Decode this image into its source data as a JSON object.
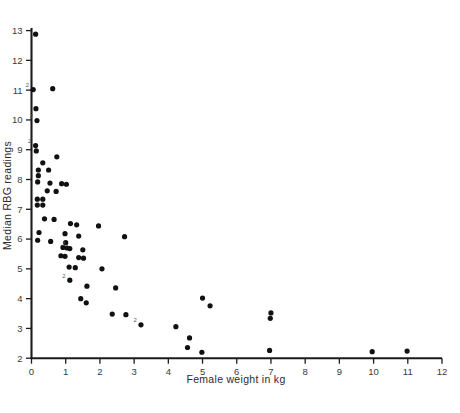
{
  "chart_data": {
    "type": "scatter",
    "title": "",
    "xlabel": "Female weight in kg",
    "ylabel": "Median RBG readings",
    "xlim": [
      0,
      12
    ],
    "ylim": [
      2,
      13
    ],
    "xticks": [
      0,
      1,
      2,
      3,
      4,
      5,
      6,
      7,
      8,
      9,
      10,
      11,
      12
    ],
    "yticks": [
      2,
      3,
      4,
      5,
      6,
      7,
      8,
      9,
      10,
      11,
      12,
      13
    ],
    "xtick_labels": [
      "0",
      "1",
      "2",
      "3",
      "4",
      "5",
      "6",
      "7",
      "8",
      "9",
      "10",
      "11",
      "12"
    ],
    "ytick_labels": [
      "2",
      "3",
      "4",
      "5",
      "6",
      "7",
      "8",
      "9",
      "10",
      "11",
      "12",
      "13"
    ],
    "grid": false,
    "legend": "none",
    "marker": "filled-circle",
    "marker_color": "#111111",
    "axis_color": "#1b1b1b",
    "overlap_annotation_note": "small '2' glyphs mark coincident duplicate observations",
    "points": [
      {
        "x": 0.12,
        "y": 12.88
      },
      {
        "x": 0.62,
        "y": 11.05
      },
      {
        "x": 0.05,
        "y": 11.02,
        "n": 2
      },
      {
        "x": 0.13,
        "y": 10.38
      },
      {
        "x": 0.16,
        "y": 9.98,
        "n": 2
      },
      {
        "x": 0.12,
        "y": 9.14,
        "n": 2
      },
      {
        "x": 0.14,
        "y": 8.96
      },
      {
        "x": 0.74,
        "y": 8.76
      },
      {
        "x": 0.33,
        "y": 8.56
      },
      {
        "x": 0.2,
        "y": 8.32
      },
      {
        "x": 0.5,
        "y": 8.32
      },
      {
        "x": 0.2,
        "y": 8.13
      },
      {
        "x": 0.18,
        "y": 7.92
      },
      {
        "x": 0.54,
        "y": 7.88
      },
      {
        "x": 0.88,
        "y": 7.86
      },
      {
        "x": 1.02,
        "y": 7.84
      },
      {
        "x": 0.46,
        "y": 7.62
      },
      {
        "x": 0.72,
        "y": 7.6
      },
      {
        "x": 0.17,
        "y": 7.34
      },
      {
        "x": 0.33,
        "y": 7.34
      },
      {
        "x": 0.17,
        "y": 7.14
      },
      {
        "x": 0.33,
        "y": 7.14
      },
      {
        "x": 0.38,
        "y": 6.68
      },
      {
        "x": 0.66,
        "y": 6.66
      },
      {
        "x": 1.14,
        "y": 6.52
      },
      {
        "x": 1.32,
        "y": 6.48
      },
      {
        "x": 1.96,
        "y": 6.44
      },
      {
        "x": 0.22,
        "y": 6.22
      },
      {
        "x": 0.98,
        "y": 6.18
      },
      {
        "x": 1.38,
        "y": 6.1
      },
      {
        "x": 2.72,
        "y": 6.08
      },
      {
        "x": 0.18,
        "y": 5.96
      },
      {
        "x": 0.56,
        "y": 5.92
      },
      {
        "x": 1.0,
        "y": 5.88
      },
      {
        "x": 0.92,
        "y": 5.72
      },
      {
        "x": 1.04,
        "y": 5.7
      },
      {
        "x": 1.12,
        "y": 5.68,
        "n": 2
      },
      {
        "x": 1.5,
        "y": 5.64
      },
      {
        "x": 0.86,
        "y": 5.44
      },
      {
        "x": 0.98,
        "y": 5.42
      },
      {
        "x": 1.38,
        "y": 5.38
      },
      {
        "x": 1.52,
        "y": 5.36
      },
      {
        "x": 1.1,
        "y": 5.06
      },
      {
        "x": 1.28,
        "y": 5.04
      },
      {
        "x": 2.06,
        "y": 5.0
      },
      {
        "x": 1.12,
        "y": 4.62,
        "n": 2
      },
      {
        "x": 1.62,
        "y": 4.42
      },
      {
        "x": 2.46,
        "y": 4.36
      },
      {
        "x": 1.44,
        "y": 4.0
      },
      {
        "x": 5.0,
        "y": 4.02
      },
      {
        "x": 1.6,
        "y": 3.86
      },
      {
        "x": 5.22,
        "y": 3.76
      },
      {
        "x": 2.36,
        "y": 3.48
      },
      {
        "x": 2.76,
        "y": 3.46
      },
      {
        "x": 7.0,
        "y": 3.52
      },
      {
        "x": 6.98,
        "y": 3.34
      },
      {
        "x": 3.2,
        "y": 3.12,
        "n": 2
      },
      {
        "x": 4.22,
        "y": 3.06
      },
      {
        "x": 4.62,
        "y": 2.68
      },
      {
        "x": 4.56,
        "y": 2.36
      },
      {
        "x": 4.98,
        "y": 2.2
      },
      {
        "x": 6.96,
        "y": 2.26
      },
      {
        "x": 9.96,
        "y": 2.22
      },
      {
        "x": 10.98,
        "y": 2.24
      }
    ]
  },
  "figure": {
    "background": "#ffffff",
    "marker_radius_px": 2.6
  }
}
